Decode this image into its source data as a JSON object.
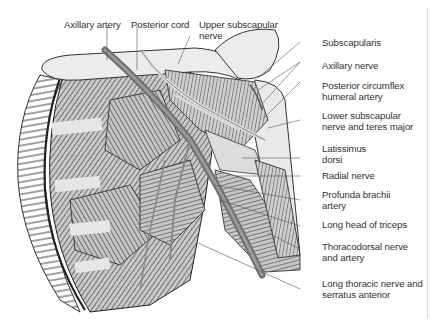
{
  "figure": {
    "labels_top": [
      {
        "id": "axillary-artery",
        "text": "Axillary artery"
      },
      {
        "id": "posterior-cord",
        "text": "Posterior cord"
      },
      {
        "id": "upper-subscapular-nerve",
        "line1": "Upper subscapular",
        "line2": "nerve"
      }
    ],
    "labels_right": [
      {
        "id": "subscapularis",
        "line1": "Subscapularis"
      },
      {
        "id": "axillary-nerve",
        "line1": "Axillary nerve"
      },
      {
        "id": "posterior-circumflex-humeral-artery",
        "line1": "Posterior circumflex",
        "line2": "humeral artery"
      },
      {
        "id": "lower-subscapular-nerve",
        "line1": "Lower subscapular",
        "line2": "nerve and teres major"
      },
      {
        "id": "latissimus-dorsi",
        "line1": "Latissimus",
        "line2": "dorsi"
      },
      {
        "id": "radial-nerve",
        "line1": "Radial nerve"
      },
      {
        "id": "profunda-brachii-artery",
        "line1": "Profunda brachii",
        "line2": "artery"
      },
      {
        "id": "long-head-triceps",
        "line1": "Long head of triceps"
      },
      {
        "id": "thoracodorsal",
        "line1": "Thoracodorsal nerve",
        "line2": "and artery"
      },
      {
        "id": "long-thoracic",
        "line1": "Long thoracic nerve and",
        "line2": "serratus anterior"
      }
    ],
    "colors": {
      "text": "#333333",
      "leader": "#555555",
      "muscle_fill": "#bdbdbd",
      "muscle_stroke": "#2a2a2a",
      "vessel": "#7a7a7a",
      "bone": "#ececec",
      "divider": "#d6d6d6"
    }
  }
}
